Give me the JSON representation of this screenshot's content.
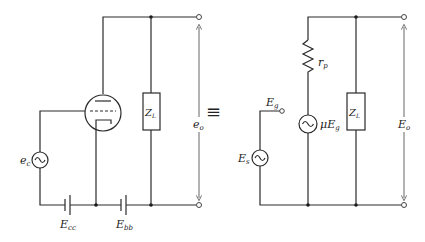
{
  "diagram": {
    "equivalence_symbol": "≡",
    "left_circuit": {
      "name": "triode amplifier",
      "labels": {
        "source": "e",
        "source_sub": "c",
        "grid_battery": "E",
        "grid_battery_sub": "cc",
        "plate_battery": "E",
        "plate_battery_sub": "bb",
        "load": "Z",
        "load_sub": "L",
        "output": "e",
        "output_sub": "o"
      }
    },
    "right_circuit": {
      "name": "equivalent voltage-source circuit",
      "labels": {
        "plate_resistance": "r",
        "plate_resistance_sub": "p",
        "dependent_source_prefix": "μE",
        "dependent_source_sub": "g",
        "grid_voltage": "E",
        "grid_voltage_sub": "g",
        "input_source": "E",
        "input_source_sub": "s",
        "load": "Z",
        "load_sub": "L",
        "output": "E",
        "output_sub": "o"
      }
    }
  }
}
